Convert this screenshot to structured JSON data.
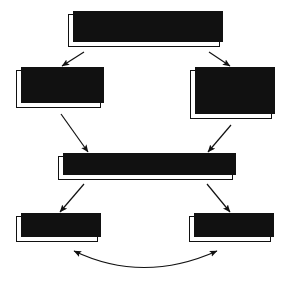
{
  "diagram": {
    "style": {
      "line_color": "#111111",
      "box_fill": "#ffffff",
      "shadow_color": "#111111",
      "background": "#ffffff"
    },
    "nodes": [
      {
        "id": "early-phonological",
        "label": "Early phonological experiences\n(onsets and rimes)"
      },
      {
        "id": "early-reading",
        "label": "Early reading\n(analogies)"
      },
      {
        "id": "early-spelling",
        "label": "Early spelling\n(attention to\nphonemes)"
      },
      {
        "id": "growing-awareness",
        "label": "Growing awareness of phonemes"
      },
      {
        "id": "reading",
        "label": "Reading"
      },
      {
        "id": "spelling",
        "label": "Spelling"
      }
    ],
    "edges": [
      {
        "id": "phonological-to-early-reading",
        "from": "early-phonological",
        "to": "early-reading",
        "kind": "straight",
        "arrowheads": "end"
      },
      {
        "id": "phonological-to-early-spelling",
        "from": "early-phonological",
        "to": "early-spelling",
        "kind": "straight",
        "arrowheads": "end"
      },
      {
        "id": "early-reading-to-growing-awareness",
        "from": "early-reading",
        "to": "growing-awareness",
        "kind": "straight",
        "arrowheads": "end"
      },
      {
        "id": "early-spelling-to-growing-awareness",
        "from": "early-spelling",
        "to": "growing-awareness",
        "kind": "straight",
        "arrowheads": "end"
      },
      {
        "id": "growing-awareness-to-reading",
        "from": "growing-awareness",
        "to": "reading",
        "kind": "straight",
        "arrowheads": "end"
      },
      {
        "id": "growing-awareness-to-spelling",
        "from": "growing-awareness",
        "to": "spelling",
        "kind": "straight",
        "arrowheads": "end"
      },
      {
        "id": "reading-spelling-bidirectional",
        "from": "reading",
        "to": "spelling",
        "kind": "curved-arc",
        "arrowheads": "both"
      }
    ]
  }
}
